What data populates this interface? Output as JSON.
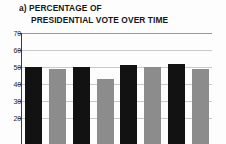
{
  "figure": {
    "panel_label": "a)",
    "title_line_1": "a) PERCENTAGE OF",
    "title_line_2": "PRESIDENTIAL VOTE OVER TIME"
  },
  "colors": {
    "series_dark": "#121212",
    "series_light": "#8c8c8c",
    "gridline": "#c9c9c9",
    "axis": "#3a3a3a",
    "background": "#fdfdfd",
    "text": "#161616"
  },
  "chart_data": {
    "type": "bar",
    "title": "a) PERCENTAGE OF PRESIDENTIAL VOTE OVER TIME",
    "xlabel": "",
    "ylabel": "",
    "ylim": [
      15,
      70
    ],
    "yticks": [
      70,
      60,
      50,
      40,
      30,
      20
    ],
    "ytick_labels": [
      "70",
      "60",
      "50",
      "40",
      "30",
      "20"
    ],
    "grid": true,
    "grid_axis": "y",
    "legend": "none",
    "categories": [
      "1",
      "2",
      "3",
      "4",
      "5",
      "6",
      "7",
      "8"
    ],
    "values": [
      50,
      49,
      50,
      43,
      51,
      50,
      52,
      49
    ],
    "bar_colors": [
      "#121212",
      "#8c8c8c",
      "#121212",
      "#8c8c8c",
      "#121212",
      "#8c8c8c",
      "#121212",
      "#8c8c8c"
    ],
    "note": "Bottom of axis is cropped by the screenshot frame below the 20 tick."
  }
}
